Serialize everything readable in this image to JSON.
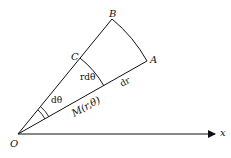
{
  "diagram": {
    "type": "polar-coordinate-area-element",
    "labels": {
      "origin": "O",
      "axis_x": "x",
      "point_A": "A",
      "point_B": "B",
      "point_C": "C",
      "angle": "dθ",
      "arc_length": "rdθ",
      "radial_increment": "dr",
      "point_M": "M(r,θ)"
    },
    "colors": {
      "stroke": "#111111",
      "background": "#ffffff"
    }
  }
}
